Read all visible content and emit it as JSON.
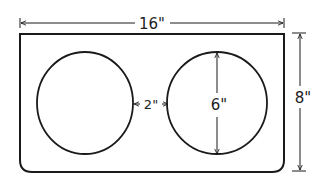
{
  "diagram": {
    "type": "dimensioned drawing",
    "dimensions": {
      "width_label": "16\"",
      "height_label": "8\"",
      "gap_label": "2\"",
      "circle_diameter_label": "6\""
    },
    "colors": {
      "line": "#1a1a1a",
      "background": "#ffffff"
    }
  }
}
